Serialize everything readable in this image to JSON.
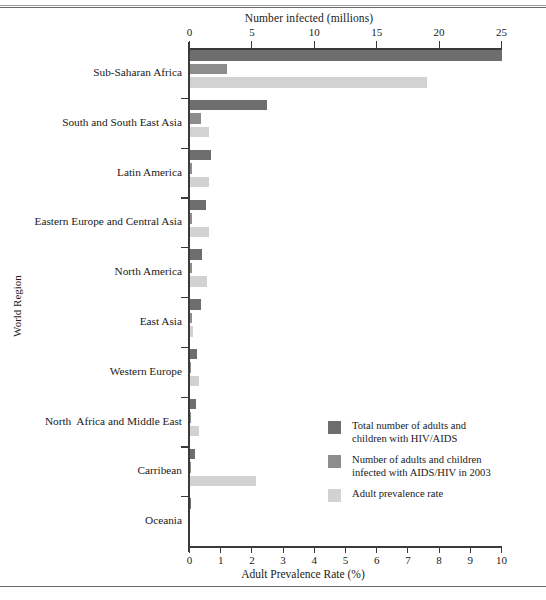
{
  "chart_data": {
    "type": "bar",
    "orientation": "horizontal",
    "title": "",
    "top_axis": {
      "label": "Number infected (millions)",
      "ticks": [
        0,
        5,
        10,
        15,
        20,
        25
      ],
      "min": 0,
      "max": 25
    },
    "bottom_axis": {
      "label": "Adult Prevalence Rate (%)",
      "ticks": [
        0,
        1,
        2,
        3,
        4,
        5,
        6,
        7,
        8,
        9,
        10
      ],
      "min": 0,
      "max": 10
    },
    "ylabel": "World Region",
    "grid": false,
    "legend_position": "inside-bottom-right",
    "categories": [
      "Sub-Saharan Africa",
      "South and South East Asia",
      "Latin America",
      "Eastern Europe and Central Asia",
      "North America",
      "East Asia",
      "Western Europe",
      "North  Africa and Middle East",
      "Carribean",
      "Oceania"
    ],
    "series": [
      {
        "name": "Total number of adults and\nchildren with HIV/AIDS",
        "color": "#6e6e6e",
        "axis": "top",
        "unit": "millions",
        "values": [
          25.0,
          6.2,
          1.7,
          1.3,
          1.0,
          0.9,
          0.6,
          0.48,
          0.43,
          0.03
        ]
      },
      {
        "name": "Number of adults and children\ninfected with AIDS/HIV in 2003",
        "color": "#8d8d8d",
        "axis": "top",
        "unit": "millions",
        "values": [
          3.0,
          0.85,
          0.2,
          0.2,
          0.15,
          0.15,
          0.04,
          0.04,
          0.05,
          0.005
        ]
      },
      {
        "name": "Adult prevalence rate",
        "color": "#d2d2d2",
        "axis": "bottom",
        "unit": "percent",
        "values": [
          7.6,
          0.6,
          0.6,
          0.6,
          0.55,
          0.1,
          0.3,
          0.3,
          2.1,
          0.0
        ]
      }
    ]
  },
  "legend": {
    "items": [
      {
        "swatch_color": "#6e6e6e",
        "label": "Total number of adults and\nchildren with HIV/AIDS"
      },
      {
        "swatch_color": "#8d8d8d",
        "label": "Number of adults and children\ninfected with AIDS/HIV in 2003"
      },
      {
        "swatch_color": "#d2d2d2",
        "label": "Adult prevalence rate"
      }
    ]
  }
}
